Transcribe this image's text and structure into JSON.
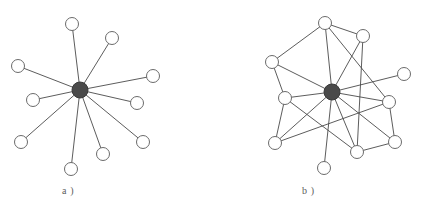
{
  "figure": {
    "background_color": "#ffffff",
    "width": 424,
    "height": 210
  },
  "style": {
    "edge_color": "#4a4a4a",
    "edge_width": 0.9,
    "leaf_fill": "#ffffff",
    "leaf_stroke": "#6b6b6b",
    "hub_fill": "#4a4a4a",
    "hub_stroke": "#3a3a3a",
    "leaf_radius": 6.5,
    "hub_radius": 8
  },
  "panels": [
    {
      "id": "a",
      "label": "a )",
      "label_x": 62,
      "label_y": 185,
      "description": "star topology: every peripheral node connects only to the central hub",
      "hub": {
        "id": "a-hub",
        "x": 80,
        "y": 90,
        "r": 8,
        "type": "hub"
      },
      "nodes": [
        {
          "id": "a1",
          "x": 72,
          "y": 24,
          "r": 6.5
        },
        {
          "id": "a2",
          "x": 112,
          "y": 38,
          "r": 6.5
        },
        {
          "id": "a3",
          "x": 18,
          "y": 66,
          "r": 6.5
        },
        {
          "id": "a4",
          "x": 153,
          "y": 76,
          "r": 6.5
        },
        {
          "id": "a5",
          "x": 33,
          "y": 100,
          "r": 6.5
        },
        {
          "id": "a6",
          "x": 137,
          "y": 103,
          "r": 6.5
        },
        {
          "id": "a7",
          "x": 21,
          "y": 142,
          "r": 6.5
        },
        {
          "id": "a8",
          "x": 143,
          "y": 142,
          "r": 6.5
        },
        {
          "id": "a9",
          "x": 103,
          "y": 154,
          "r": 6.5
        },
        {
          "id": "a10",
          "x": 71,
          "y": 169,
          "r": 6.5
        }
      ],
      "edges": [
        [
          "a-hub",
          "a1"
        ],
        [
          "a-hub",
          "a2"
        ],
        [
          "a-hub",
          "a3"
        ],
        [
          "a-hub",
          "a4"
        ],
        [
          "a-hub",
          "a5"
        ],
        [
          "a-hub",
          "a6"
        ],
        [
          "a-hub",
          "a7"
        ],
        [
          "a-hub",
          "a8"
        ],
        [
          "a-hub",
          "a9"
        ],
        [
          "a-hub",
          "a10"
        ]
      ]
    },
    {
      "id": "b",
      "label": "b )",
      "label_x": 302,
      "label_y": 185,
      "description": "mesh topology: hub plus additional peer-to-peer links between peripheral nodes",
      "hub": {
        "id": "b-hub",
        "x": 332,
        "y": 92,
        "r": 8,
        "type": "hub"
      },
      "nodes": [
        {
          "id": "b1",
          "x": 325,
          "y": 23,
          "r": 6.5
        },
        {
          "id": "b2",
          "x": 363,
          "y": 36,
          "r": 6.5
        },
        {
          "id": "b3",
          "x": 272,
          "y": 62,
          "r": 6.5
        },
        {
          "id": "b4",
          "x": 404,
          "y": 74,
          "r": 6.5
        },
        {
          "id": "b5",
          "x": 285,
          "y": 98,
          "r": 6.5
        },
        {
          "id": "b6",
          "x": 389,
          "y": 102,
          "r": 6.5
        },
        {
          "id": "b7",
          "x": 275,
          "y": 143,
          "r": 6.5
        },
        {
          "id": "b8",
          "x": 395,
          "y": 142,
          "r": 6.5
        },
        {
          "id": "b9",
          "x": 357,
          "y": 152,
          "r": 6.5
        },
        {
          "id": "b10",
          "x": 324,
          "y": 168,
          "r": 6.5
        }
      ],
      "edges": [
        [
          "b-hub",
          "b1"
        ],
        [
          "b-hub",
          "b2"
        ],
        [
          "b-hub",
          "b3"
        ],
        [
          "b-hub",
          "b4"
        ],
        [
          "b-hub",
          "b5"
        ],
        [
          "b-hub",
          "b6"
        ],
        [
          "b-hub",
          "b7"
        ],
        [
          "b-hub",
          "b8"
        ],
        [
          "b-hub",
          "b9"
        ],
        [
          "b-hub",
          "b10"
        ],
        [
          "b1",
          "b2"
        ],
        [
          "b1",
          "b3"
        ],
        [
          "b1",
          "b6"
        ],
        [
          "b2",
          "b9"
        ],
        [
          "b3",
          "b5"
        ],
        [
          "b5",
          "b7"
        ],
        [
          "b5",
          "b9"
        ],
        [
          "b6",
          "b7"
        ],
        [
          "b6",
          "b8"
        ],
        [
          "b8",
          "b9"
        ]
      ]
    }
  ]
}
